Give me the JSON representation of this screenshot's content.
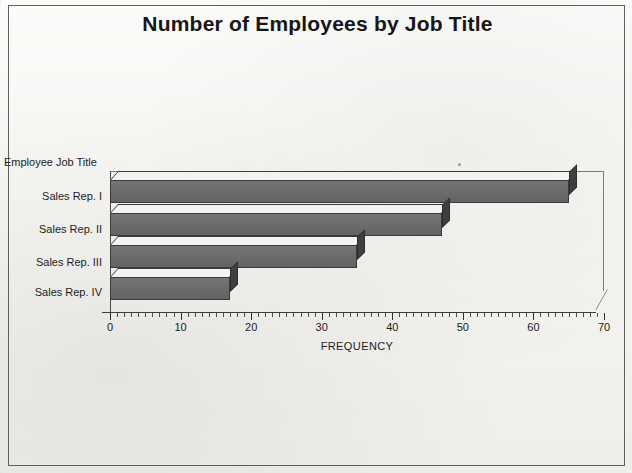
{
  "figure": {
    "title": "Number of Employees by Job Title",
    "frame_border_color": "#5e5e5e",
    "background_color": "#f2f1ee",
    "bar_front_color": "#6d6d6d",
    "bar_top_color": "#f4f3f0",
    "bar_side_color": "#3f3f3f"
  },
  "chart_data": {
    "type": "bar",
    "orientation": "horizontal",
    "title": "Number of Employees by Job Title",
    "xlabel": "FREQUENCY",
    "ylabel": "Employee Job Title",
    "categories": [
      "Sales Rep. I",
      "Sales Rep. II",
      "Sales Rep. III",
      "Sales Rep. IV"
    ],
    "values": [
      65,
      47,
      35,
      17
    ],
    "xlim": [
      0,
      70
    ],
    "xticks": [
      0,
      10,
      20,
      30,
      40,
      50,
      60,
      70
    ],
    "xtick_labels": [
      "0",
      "10",
      "20",
      "30",
      "40",
      "50",
      "60",
      "70"
    ],
    "minor_tick_interval": 1,
    "grid": false,
    "legend": false,
    "style": "3d-bar"
  },
  "axes": {
    "y_axis_title": "Employee Job Title",
    "x_axis_title": "FREQUENCY",
    "category_labels": [
      "Sales Rep. I",
      "Sales Rep. II",
      "Sales Rep. III",
      "Sales Rep. IV"
    ],
    "x_tick_labels": [
      "0",
      "10",
      "20",
      "30",
      "40",
      "50",
      "60",
      "70"
    ]
  }
}
